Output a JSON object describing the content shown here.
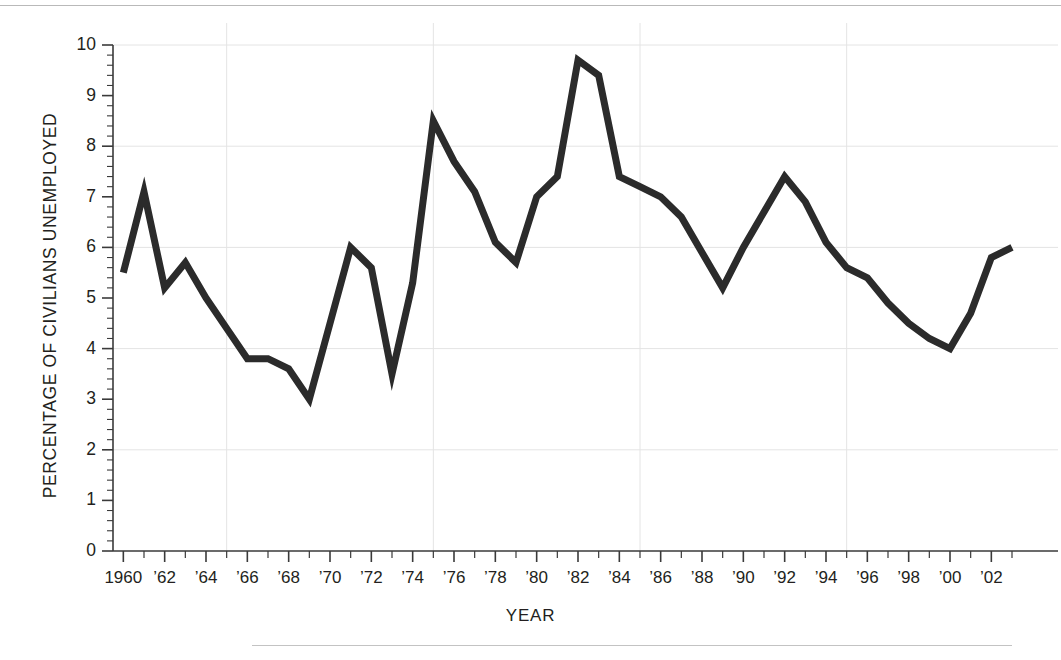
{
  "chart_data": {
    "type": "line",
    "title": "",
    "xlabel": "YEAR",
    "ylabel": "PERCENTAGE OF CIVILIANS UNEMPLOYED",
    "xlim": [
      1959.5,
      2003.0
    ],
    "ylim": [
      0,
      10
    ],
    "grid": true,
    "legend": null,
    "y_ticks": [
      0,
      1,
      2,
      3,
      4,
      5,
      6,
      7,
      8,
      9,
      10
    ],
    "y_tick_labels": [
      "0",
      "1",
      "2",
      "3",
      "4",
      "5",
      "6",
      "7",
      "8",
      "9",
      "10"
    ],
    "y_minor_tick_step": 0.2,
    "x_ticks": [
      1960,
      1961,
      1962,
      1963,
      1964,
      1965,
      1966,
      1967,
      1968,
      1969,
      1970,
      1971,
      1972,
      1973,
      1974,
      1975,
      1976,
      1977,
      1978,
      1979,
      1980,
      1981,
      1982,
      1983,
      1984,
      1985,
      1986,
      1987,
      1988,
      1989,
      1990,
      1991,
      1992,
      1993,
      1994,
      1995,
      1996,
      1997,
      1998,
      1999,
      2000,
      2001,
      2002,
      2003
    ],
    "x_tick_labels": [
      {
        "x": 1960,
        "label": "1960"
      },
      {
        "x": 1962,
        "label": "’62"
      },
      {
        "x": 1964,
        "label": "’64"
      },
      {
        "x": 1966,
        "label": "’66"
      },
      {
        "x": 1968,
        "label": "’68"
      },
      {
        "x": 1970,
        "label": "’70"
      },
      {
        "x": 1972,
        "label": "’72"
      },
      {
        "x": 1974,
        "label": "’74"
      },
      {
        "x": 1976,
        "label": "’76"
      },
      {
        "x": 1978,
        "label": "’78"
      },
      {
        "x": 1980,
        "label": "’80"
      },
      {
        "x": 1982,
        "label": "’82"
      },
      {
        "x": 1984,
        "label": "’84"
      },
      {
        "x": 1986,
        "label": "’86"
      },
      {
        "x": 1988,
        "label": "’88"
      },
      {
        "x": 1990,
        "label": "’90"
      },
      {
        "x": 1992,
        "label": "’92"
      },
      {
        "x": 1994,
        "label": "’94"
      },
      {
        "x": 1996,
        "label": "’96"
      },
      {
        "x": 1998,
        "label": "’98"
      },
      {
        "x": 2000,
        "label": "’00"
      },
      {
        "x": 2002,
        "label": "’02"
      }
    ],
    "x_gridlines": [
      1965,
      1975,
      1985,
      1995
    ],
    "y_gridlines": [
      2,
      4,
      6,
      8,
      10
    ],
    "line_color": "#2b2b2b",
    "line_width": 7,
    "x": [
      1960,
      1961,
      1962,
      1963,
      1964,
      1965,
      1966,
      1967,
      1968,
      1969,
      1970,
      1971,
      1972,
      1973,
      1974,
      1975,
      1976,
      1977,
      1978,
      1979,
      1980,
      1981,
      1982,
      1983,
      1984,
      1985,
      1986,
      1987,
      1988,
      1989,
      1990,
      1991,
      1992,
      1993,
      1994,
      1995,
      1996,
      1997,
      1998,
      1999,
      2000,
      2001,
      2002,
      2003
    ],
    "values": [
      5.5,
      7.1,
      5.2,
      5.7,
      5.0,
      4.4,
      3.8,
      3.8,
      3.6,
      3.0,
      4.5,
      6.0,
      5.6,
      3.5,
      5.3,
      8.5,
      7.7,
      7.1,
      6.1,
      5.7,
      7.0,
      7.4,
      9.7,
      9.4,
      7.4,
      7.2,
      7.0,
      6.6,
      5.9,
      5.2,
      6.0,
      6.7,
      7.4,
      6.9,
      6.1,
      5.6,
      5.4,
      4.9,
      4.5,
      4.2,
      4.0,
      4.7,
      5.8,
      6.0
    ],
    "series": [
      {
        "name": "Percentage of civilians unemployed",
        "values": [
          5.5,
          7.1,
          5.2,
          5.7,
          5.0,
          4.4,
          3.8,
          3.8,
          3.6,
          3.0,
          4.5,
          6.0,
          5.6,
          3.5,
          5.3,
          8.5,
          7.7,
          7.1,
          6.1,
          5.7,
          7.0,
          7.4,
          9.7,
          9.4,
          7.4,
          7.2,
          7.0,
          6.6,
          5.9,
          5.2,
          6.0,
          6.7,
          7.4,
          6.9,
          6.1,
          5.6,
          5.4,
          4.9,
          4.5,
          4.2,
          4.0,
          4.7,
          5.8,
          6.0
        ]
      }
    ]
  },
  "colors": {
    "line": "#2b2b2b",
    "axis": "#3a3a3a",
    "grid": "#e4e4e4",
    "rule": "#b9b9b9",
    "text": "#231f20"
  }
}
